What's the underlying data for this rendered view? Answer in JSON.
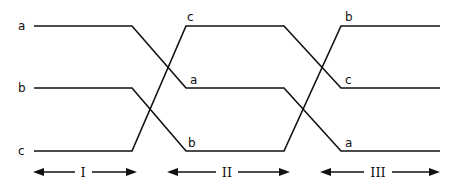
{
  "diagram": {
    "title": "",
    "levels": [
      "top",
      "middle",
      "bottom"
    ],
    "left_labels": [
      "a",
      "b",
      "c"
    ],
    "stages": [
      {
        "name": "I",
        "order_top_to_bottom": [
          "a",
          "b",
          "c"
        ]
      },
      {
        "name": "II",
        "order_top_to_bottom": [
          "c",
          "a",
          "b"
        ]
      },
      {
        "name": "III",
        "order_top_to_bottom": [
          "b",
          "c",
          "a"
        ]
      }
    ],
    "stage_ii_labels": {
      "top": "c",
      "middle": "a",
      "bottom": "b"
    },
    "stage_iii_labels": {
      "top": "b",
      "middle": "c",
      "bottom": "a"
    },
    "region_labels": [
      "I",
      "II",
      "III"
    ],
    "colors": {
      "line": "#111111",
      "background": "#ffffff"
    }
  }
}
